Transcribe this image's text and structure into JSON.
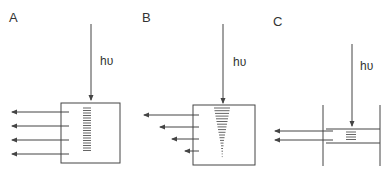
{
  "figure": {
    "colors": {
      "line": "#444444",
      "stripe": "#555555",
      "background": "#ffffff"
    },
    "panels": [
      {
        "id": "A",
        "label": "A",
        "photon_label": "hυ",
        "description": "Uniform excitation across a thick slab; emission arrows equal length",
        "emission_arrows": 4,
        "stripe_pattern": "uniform"
      },
      {
        "id": "B",
        "label": "B",
        "photon_label": "hυ",
        "description": "Excitation decaying with depth; emission arrows decreasing length",
        "emission_arrows": 4,
        "stripe_pattern": "tapered"
      },
      {
        "id": "C",
        "label": "C",
        "photon_label": "hυ",
        "description": "Thin layer excited; two emission arrows",
        "emission_arrows": 2,
        "stripe_pattern": "small-block"
      }
    ]
  }
}
